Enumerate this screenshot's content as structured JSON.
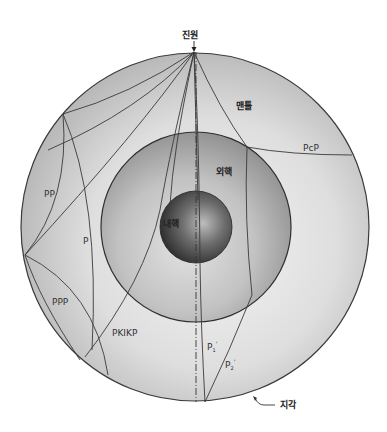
{
  "figure": {
    "title_source": "진원",
    "label_station": "지각",
    "layers": {
      "mantle": "맨틀",
      "outer_core": "외핵",
      "inner_core": "내핵"
    },
    "ray_labels": {
      "pcp": "PcP",
      "pp": "PP",
      "p": "P",
      "ppp": "PPP",
      "pkikp": "PKIKP",
      "p1": "P",
      "p1_sub": "1",
      "p2": "P",
      "p2_sub": "2",
      "prime": "'"
    },
    "colors": {
      "mantle_light": "#efefef",
      "mantle_dark": "#b4b4b4",
      "outer_core_light": "#d6d6d6",
      "outer_core_dark": "#8e8e8e",
      "inner_core_light": "#9a9a9a",
      "inner_core_dark": "#2a2a2a",
      "line": "#3a3a3a"
    }
  }
}
